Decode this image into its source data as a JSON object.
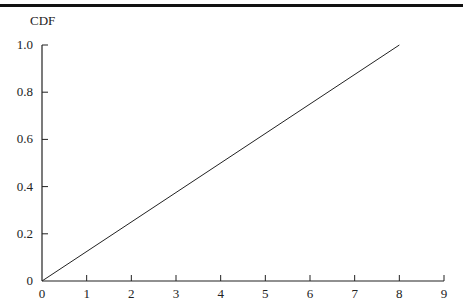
{
  "chart_data": {
    "type": "line",
    "title": "",
    "xlabel": "",
    "ylabel": "CDF",
    "xlim": [
      0,
      9
    ],
    "ylim": [
      0,
      1.0
    ],
    "x_ticks": [
      "0",
      "1",
      "2",
      "3",
      "4",
      "5",
      "6",
      "7",
      "8",
      "9"
    ],
    "y_ticks": [
      "0",
      "0.2",
      "0.4",
      "0.6",
      "0.8",
      "1.0"
    ],
    "grid": false,
    "legend": null,
    "series": [
      {
        "name": "CDF",
        "x": [
          0,
          8
        ],
        "y": [
          0,
          1.0
        ]
      }
    ]
  }
}
